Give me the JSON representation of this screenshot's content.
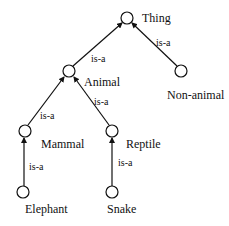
{
  "diagram": {
    "type": "is-a hierarchy (semantic network)",
    "nodes": [
      {
        "id": "thing",
        "label": "Thing",
        "cx": 127,
        "cy": 18
      },
      {
        "id": "animal",
        "label": "Animal",
        "cx": 69,
        "cy": 71
      },
      {
        "id": "non_animal",
        "label": "Non-animal",
        "cx": 181,
        "cy": 71
      },
      {
        "id": "mammal",
        "label": "Mammal",
        "cx": 25,
        "cy": 131
      },
      {
        "id": "reptile",
        "label": "Reptile",
        "cx": 112,
        "cy": 131
      },
      {
        "id": "elephant",
        "label": "Elephant",
        "cx": 23,
        "cy": 192
      },
      {
        "id": "snake",
        "label": "Snake",
        "cx": 112,
        "cy": 192
      }
    ],
    "edges": [
      {
        "from": "animal",
        "to": "thing",
        "label": "is-a"
      },
      {
        "from": "non_animal",
        "to": "thing",
        "label": "is-a"
      },
      {
        "from": "mammal",
        "to": "animal",
        "label": "is-a"
      },
      {
        "from": "reptile",
        "to": "animal",
        "label": "is-a"
      },
      {
        "from": "elephant",
        "to": "mammal",
        "label": "is-a"
      },
      {
        "from": "snake",
        "to": "reptile",
        "label": "is-a"
      }
    ]
  },
  "labels": {
    "thing": "Thing",
    "animal": "Animal",
    "non_animal": "Non-animal",
    "mammal": "Mammal",
    "reptile": "Reptile",
    "elephant": "Elephant",
    "snake": "Snake",
    "edge_animal_thing": "is-a",
    "edge_nonanimal_thing": "is-a",
    "edge_mammal_animal": "is-a",
    "edge_reptile_animal": "is-a",
    "edge_elephant_mammal": "is-a",
    "edge_snake_reptile": "is-a"
  }
}
